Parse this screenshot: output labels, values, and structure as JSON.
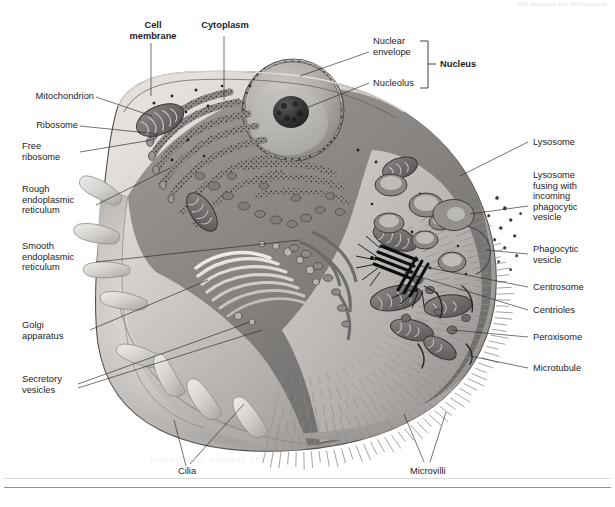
{
  "header": {
    "running_head": "Cell structures and their functions"
  },
  "watermark": {
    "line1": "CELL STRUCTURE",
    "line2": "eukaryotic animal cell"
  },
  "figure": {
    "style": "grayscale airbrush illustration",
    "colors": {
      "cytoplasm_light": "#cfcbc8",
      "cytoplasm_mid": "#a8a5a3",
      "cytoplasm_dark": "#6f6d6c",
      "membrane_outline": "#5a5857",
      "nucleoplasm": "#b5b2af",
      "nucleolus": "#3a3837",
      "organelle_dark": "#4c4a49",
      "centriole": "#141414",
      "leader_line": "#2a2a2a",
      "text": "#1d1d1d",
      "background": "#ffffff"
    }
  },
  "labels": {
    "cell_membrane": "Cell\nmembrane",
    "cytoplasm": "Cytoplasm",
    "nuclear_envelope": "Nuclear\nenvelope",
    "nucleolus": "Nucleolus",
    "nucleus": "Nucleus",
    "mitochondrion": "Mitochondrion",
    "ribosome": "Ribosome",
    "free_ribosome": "Free\nribosome",
    "rough_er": "Rough\nendoplasmic\nreticulum",
    "smooth_er": "Smooth\nendoplasmic\nreticulum",
    "golgi": "Golgi\napparatus",
    "secretory_vesicles": "Secretory\nvesicles",
    "lysosome": "Lysosome",
    "lysosome_fusing": "Lysosome\nfusing with\nincoming\nphagocytic\nvesicle",
    "phagocytic_vesicle": "Phagocytic\nvesicle",
    "centrosome": "Centrosome",
    "centrioles": "Centrioles",
    "peroxisome": "Peroxisome",
    "microtubule": "Microtubule",
    "cilia": "Cilia",
    "microvilli": "Microvilli"
  }
}
